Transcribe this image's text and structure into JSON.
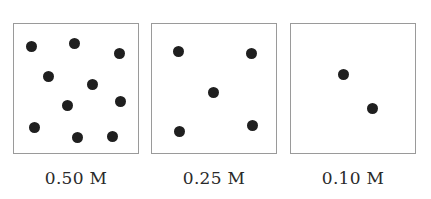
{
  "diagram": {
    "title": "",
    "panels": [
      {
        "label": "0.50 M",
        "left": 13,
        "particles": [
          [
            17,
            22
          ],
          [
            60,
            19
          ],
          [
            105,
            29
          ],
          [
            34,
            52
          ],
          [
            78,
            60
          ],
          [
            53,
            81
          ],
          [
            106,
            77
          ],
          [
            20,
            103
          ],
          [
            63,
            113
          ],
          [
            98,
            112
          ]
        ]
      },
      {
        "label": "0.25 M",
        "left": 151,
        "particles": [
          [
            26,
            27
          ],
          [
            99,
            29
          ],
          [
            61,
            68
          ],
          [
            27,
            107
          ],
          [
            100,
            101
          ]
        ]
      },
      {
        "label": "0.10 M",
        "left": 290,
        "particles": [
          [
            52,
            50
          ],
          [
            81,
            84
          ]
        ]
      }
    ],
    "colors": {
      "border": "#9a9a9a",
      "particle": "#1f1f1f",
      "text": "#2a2a2a"
    }
  }
}
